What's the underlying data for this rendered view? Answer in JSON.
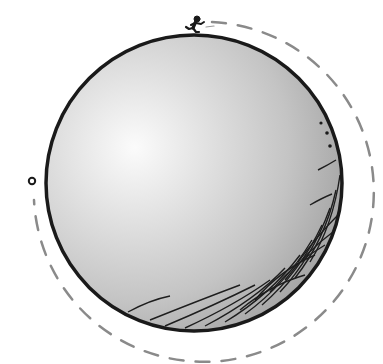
{
  "illustration": {
    "subject": "Figure running around a small spherical planet",
    "sphere": {
      "cx": 194,
      "cy": 183,
      "r": 148,
      "fill_light": "#f4f4f4",
      "fill_mid": "#c9c9c9",
      "fill_dark": "#9a9a9a",
      "outline": "#1a1a1a"
    },
    "orbit_path": {
      "style": "dashed",
      "color": "#8a8a8a",
      "start": "runner at top of sphere",
      "end": "small circle at left side"
    },
    "runner": {
      "x": 194,
      "y": 26,
      "color": "#1a1a1a"
    },
    "start_marker": {
      "shape": "small-ring",
      "x": 32,
      "y": 181,
      "color": "#1a1a1a"
    },
    "surface_marks": {
      "dots": 3,
      "hatching": "lower-right shadow cross-hatch"
    }
  }
}
